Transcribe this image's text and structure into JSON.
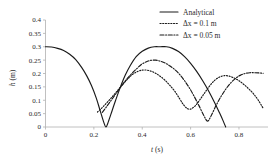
{
  "chart_data": {
    "type": "line",
    "title": "",
    "xlabel": "t (s)",
    "ylabel": "h (m)",
    "xlim": [
      0,
      0.92
    ],
    "ylim": [
      0,
      0.4
    ],
    "grid": false,
    "legend_position": "top-right",
    "x_ticks": [
      "0",
      "0.2",
      "0.4",
      "0.6",
      "0.8"
    ],
    "x_tick_values": [
      0,
      0.2,
      0.4,
      0.6,
      0.8
    ],
    "y_ticks": [
      "0",
      "0.05",
      "0.1",
      "0.15",
      "0.2",
      "0.25",
      "0.3",
      "0.35",
      "0.4"
    ],
    "y_tick_values": [
      0,
      0.05,
      0.1,
      0.15,
      0.2,
      0.25,
      0.3,
      0.35,
      0.4
    ],
    "series": [
      {
        "name": "Analytical",
        "style": "solid",
        "color": "#1a1a1a",
        "x": [
          0.0,
          0.025,
          0.05,
          0.075,
          0.1,
          0.125,
          0.15,
          0.17,
          0.19,
          0.21,
          0.225,
          0.24,
          0.25,
          0.26,
          0.275,
          0.29,
          0.31,
          0.33,
          0.35,
          0.375,
          0.4,
          0.425,
          0.45,
          0.475,
          0.5,
          0.525,
          0.55,
          0.575,
          0.6,
          0.625,
          0.65,
          0.675,
          0.7,
          0.72,
          0.735,
          0.745
        ],
        "y": [
          0.3,
          0.299,
          0.294,
          0.286,
          0.272,
          0.252,
          0.222,
          0.192,
          0.155,
          0.108,
          0.064,
          0.02,
          0.0,
          0.02,
          0.06,
          0.1,
          0.15,
          0.194,
          0.229,
          0.263,
          0.283,
          0.295,
          0.3,
          0.3,
          0.3,
          0.294,
          0.282,
          0.263,
          0.238,
          0.208,
          0.173,
          0.134,
          0.09,
          0.052,
          0.022,
          0.0
        ]
      },
      {
        "name": "Δx = 0.1 m",
        "style": "dotted",
        "color": "#1a1a1a",
        "x": [
          0.215,
          0.235,
          0.255,
          0.275,
          0.295,
          0.315,
          0.335,
          0.355,
          0.375,
          0.395,
          0.415,
          0.435,
          0.455,
          0.475,
          0.495,
          0.515,
          0.535,
          0.555,
          0.57,
          0.585,
          0.6,
          0.62,
          0.64,
          0.66,
          0.68,
          0.7,
          0.72,
          0.74,
          0.76,
          0.78,
          0.8,
          0.82,
          0.84,
          0.86,
          0.88,
          0.9
        ],
        "y": [
          0.056,
          0.073,
          0.092,
          0.112,
          0.133,
          0.155,
          0.175,
          0.193,
          0.205,
          0.212,
          0.213,
          0.209,
          0.201,
          0.189,
          0.174,
          0.155,
          0.133,
          0.105,
          0.084,
          0.07,
          0.067,
          0.08,
          0.104,
          0.13,
          0.155,
          0.175,
          0.187,
          0.192,
          0.19,
          0.183,
          0.173,
          0.159,
          0.143,
          0.124,
          0.1,
          0.07
        ]
      },
      {
        "name": "Δx = 0.05 m",
        "style": "dashdot",
        "color": "#1a1a1a",
        "x": [
          0.235,
          0.255,
          0.275,
          0.295,
          0.315,
          0.335,
          0.355,
          0.375,
          0.395,
          0.415,
          0.435,
          0.455,
          0.475,
          0.495,
          0.515,
          0.535,
          0.555,
          0.575,
          0.595,
          0.615,
          0.635,
          0.655,
          0.67,
          0.685,
          0.705,
          0.725,
          0.745,
          0.765,
          0.785,
          0.805,
          0.825,
          0.845,
          0.865,
          0.885,
          0.9
        ],
        "y": [
          0.055,
          0.079,
          0.104,
          0.129,
          0.154,
          0.178,
          0.198,
          0.216,
          0.233,
          0.243,
          0.249,
          0.25,
          0.246,
          0.239,
          0.228,
          0.214,
          0.196,
          0.173,
          0.146,
          0.114,
          0.079,
          0.042,
          0.022,
          0.042,
          0.08,
          0.113,
          0.141,
          0.164,
          0.181,
          0.193,
          0.2,
          0.203,
          0.203,
          0.202,
          0.201
        ]
      }
    ],
    "legend": [
      {
        "label": "Analytical",
        "style": "solid"
      },
      {
        "label": "Δx = 0.1 m",
        "style": "dotted"
      },
      {
        "label": "Δx = 0.05 m",
        "style": "dashdot"
      }
    ]
  }
}
